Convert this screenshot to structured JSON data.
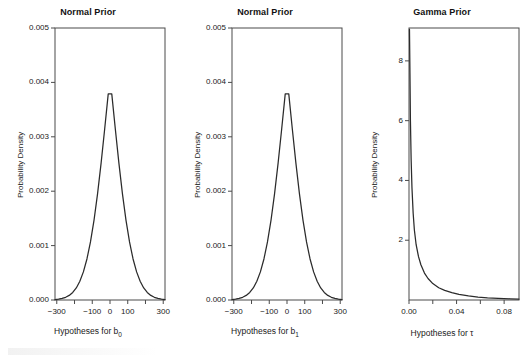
{
  "figure": {
    "background": "#ffffff",
    "line_color": "#2b2b2b",
    "axis_color": "#4a4a4a",
    "panel_count": 3
  },
  "chart_data": [
    {
      "type": "line",
      "title": "Normal Prior",
      "xlabel": "Hypotheses for b",
      "xlabel_sub": "0",
      "ylabel": "Probability Density",
      "distribution": "normal",
      "mean": 0,
      "sd": 100,
      "peak_density": 0.004,
      "xlim": [
        -310,
        310
      ],
      "ylim": [
        0.0,
        0.005
      ],
      "grid": false,
      "legend": "none",
      "xticks": [
        -300,
        -200,
        -100,
        0,
        100,
        200,
        300
      ],
      "xtick_labels": [
        "-300",
        "",
        "-100",
        "0",
        "100",
        "",
        "300"
      ],
      "yticks": [
        0.0,
        0.001,
        0.002,
        0.003,
        0.004,
        0.005
      ],
      "ytick_labels": [
        "0.000",
        "0.001",
        "0.002",
        "0.003",
        "0.004",
        "0.005"
      ],
      "x": [
        -310,
        -290,
        -270,
        -250,
        -230,
        -210,
        -190,
        -170,
        -150,
        -130,
        -110,
        -90,
        -70,
        -50,
        -30,
        -10,
        10,
        30,
        50,
        70,
        90,
        110,
        130,
        150,
        170,
        190,
        210,
        230,
        250,
        270,
        290,
        310
      ],
      "y": [
        8.3e-06,
        1.56e-05,
        2.83e-05,
        4.97e-05,
        8.44e-05,
        0.000139,
        0.000222,
        0.000344,
        0.000517,
        0.000754,
        0.001068,
        0.001468,
        0.001956,
        0.00252,
        0.003144,
        0.00379,
        0.00379,
        0.003144,
        0.00252,
        0.001956,
        0.001468,
        0.001068,
        0.000754,
        0.000517,
        0.000344,
        0.000222,
        0.000139,
        8.44e-05,
        4.97e-05,
        2.83e-05,
        1.56e-05,
        8.3e-06
      ]
    },
    {
      "type": "line",
      "title": "Normal Prior",
      "xlabel": "Hypotheses for b",
      "xlabel_sub": "1",
      "ylabel": "Probability Density",
      "distribution": "normal",
      "mean": 0,
      "sd": 100,
      "peak_density": 0.004,
      "xlim": [
        -310,
        310
      ],
      "ylim": [
        0.0,
        0.005
      ],
      "grid": false,
      "legend": "none",
      "xticks": [
        -300,
        -200,
        -100,
        0,
        100,
        200,
        300
      ],
      "xtick_labels": [
        "-300",
        "",
        "-100",
        "0",
        "100",
        "",
        "300"
      ],
      "yticks": [
        0.0,
        0.001,
        0.002,
        0.003,
        0.004,
        0.005
      ],
      "ytick_labels": [
        "0.000",
        "0.001",
        "0.002",
        "0.003",
        "0.004",
        "0.005"
      ],
      "x": [
        -310,
        -290,
        -270,
        -250,
        -230,
        -210,
        -190,
        -170,
        -150,
        -130,
        -110,
        -90,
        -70,
        -50,
        -30,
        -10,
        10,
        30,
        50,
        70,
        90,
        110,
        130,
        150,
        170,
        190,
        210,
        230,
        250,
        270,
        290,
        310
      ],
      "y": [
        8.3e-06,
        1.56e-05,
        2.83e-05,
        4.97e-05,
        8.44e-05,
        0.000139,
        0.000222,
        0.000344,
        0.000517,
        0.000754,
        0.001068,
        0.001468,
        0.001956,
        0.00252,
        0.003144,
        0.00379,
        0.00379,
        0.003144,
        0.00252,
        0.001956,
        0.001468,
        0.001068,
        0.000754,
        0.000517,
        0.000344,
        0.000222,
        0.000139,
        8.44e-05,
        4.97e-05,
        2.83e-05,
        1.56e-05,
        8.3e-06
      ]
    },
    {
      "type": "line",
      "title": "Gamma Prior",
      "xlabel": "Hypotheses for τ",
      "xlabel_sub": "",
      "ylabel": "Probability Density",
      "distribution": "gamma",
      "shape": 0.5,
      "rate": 50,
      "xlim": [
        0.0,
        0.0925
      ],
      "ylim": [
        0.0,
        9.1
      ],
      "grid": false,
      "legend": "none",
      "xticks": [
        0.0,
        0.02,
        0.04,
        0.06,
        0.08
      ],
      "xtick_labels": [
        "0.00",
        "",
        "0.04",
        "",
        "0.08"
      ],
      "yticks": [
        2,
        4,
        6,
        8
      ],
      "ytick_labels": [
        "2",
        "4",
        "6",
        "8"
      ],
      "x": [
        0.0004,
        0.0008,
        0.0012,
        0.0018,
        0.0025,
        0.0035,
        0.0045,
        0.006,
        0.008,
        0.01,
        0.013,
        0.016,
        0.02,
        0.025,
        0.03,
        0.036,
        0.042,
        0.05,
        0.058,
        0.066,
        0.075,
        0.085,
        0.0925
      ],
      "y": [
        9.05,
        7.6,
        6.0,
        4.7,
        3.75,
        2.9,
        2.35,
        1.85,
        1.45,
        1.18,
        0.9,
        0.72,
        0.55,
        0.41,
        0.32,
        0.25,
        0.19,
        0.14,
        0.1,
        0.075,
        0.055,
        0.04,
        0.032
      ]
    }
  ]
}
